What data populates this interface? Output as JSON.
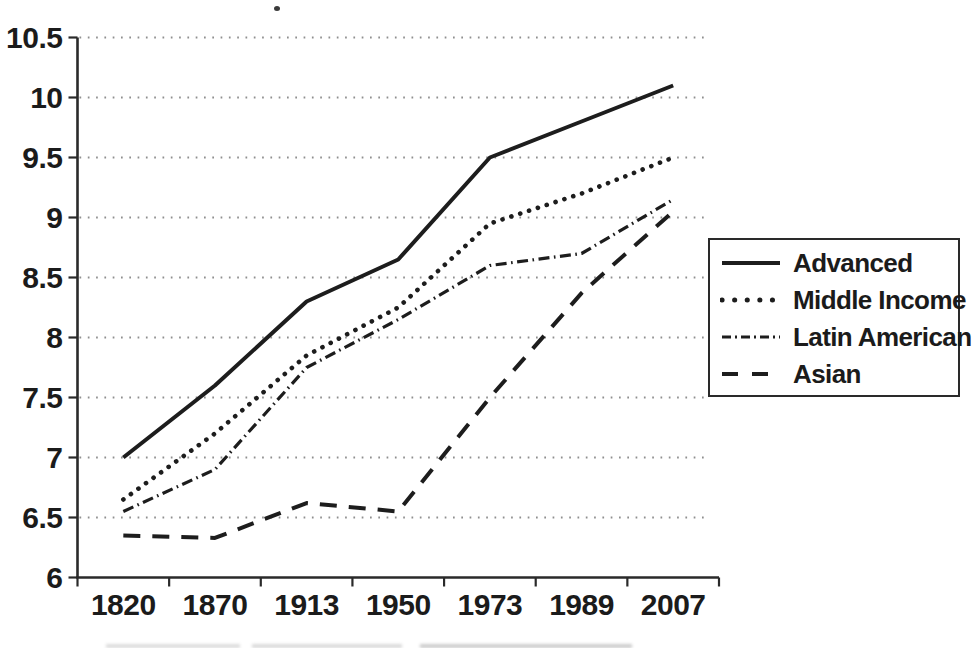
{
  "chart_data": {
    "type": "line",
    "title": "",
    "xlabel": "",
    "ylabel": "",
    "categories": [
      "1820",
      "1870",
      "1913",
      "1950",
      "1973",
      "1989",
      "2007"
    ],
    "y_tick_labels": [
      "10.5",
      "10",
      "9.5",
      "9",
      "8.5",
      "8",
      "7.5",
      "7",
      "6.5",
      "6"
    ],
    "ylim": [
      6,
      10.5
    ],
    "y_step": 0.5,
    "grid": "horizontal dotted gridlines at every 0.5 tick",
    "legend_position": "right-middle, boxed",
    "line_color": "#1d1d1d",
    "gridline_color": "#8f8f8f",
    "series": [
      {
        "name": "Advanced",
        "style": "solid",
        "values": [
          7.0,
          7.6,
          8.3,
          8.65,
          9.5,
          9.8,
          10.1
        ]
      },
      {
        "name": "Middle Income",
        "style": "dotted",
        "values": [
          6.65,
          7.2,
          7.85,
          8.25,
          8.95,
          9.2,
          9.5
        ]
      },
      {
        "name": "Latin American",
        "style": "dash-dot",
        "values": [
          6.55,
          6.9,
          7.75,
          8.15,
          8.6,
          8.7,
          9.15
        ]
      },
      {
        "name": "Asian",
        "style": "dashed",
        "values": [
          6.35,
          6.33,
          6.62,
          6.55,
          7.5,
          8.37,
          9.05
        ]
      }
    ]
  },
  "legend": {
    "items": [
      "Advanced",
      "Middle Income",
      "Latin American",
      "Asian"
    ]
  }
}
